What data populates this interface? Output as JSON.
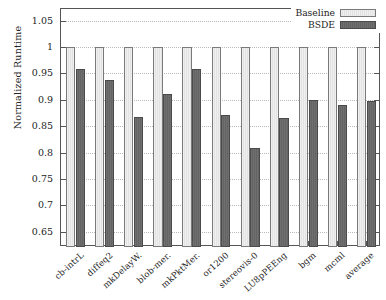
{
  "chart_data": {
    "type": "bar",
    "title": "",
    "xlabel": "",
    "ylabel": "Normalized Runtime",
    "ylim": [
      0.621,
      1.072
    ],
    "yticks": [
      0.65,
      0.7,
      0.75,
      0.8,
      0.85,
      0.9,
      0.95,
      1,
      1.05
    ],
    "ytick_labels": [
      "0.65",
      "0.7",
      "0.75",
      "0.8",
      "0.85",
      "0.9",
      "0.95",
      "1",
      "1.05"
    ],
    "grid": true,
    "legend_position": "top-right",
    "categories": [
      "cb-intrL",
      "diffeq2",
      "mkDelayW.",
      "blob-mer.",
      "mkPktMer.",
      "or1200",
      "stereovis-0",
      "LU8pPEEng",
      "bgm",
      "mcml",
      "average"
    ],
    "series": [
      {
        "name": "Baseline",
        "color": "#e8e8e8",
        "values": [
          1,
          1,
          1,
          1,
          1,
          1,
          1,
          1,
          1,
          1,
          1
        ]
      },
      {
        "name": "BSDE",
        "color": "#6a6a6a",
        "values": [
          0.958,
          0.937,
          0.867,
          0.911,
          0.958,
          0.872,
          0.809,
          0.866,
          0.899,
          0.891,
          0.897
        ]
      }
    ]
  },
  "legend": {
    "items": [
      {
        "label": "Baseline",
        "swatch": "baseline"
      },
      {
        "label": "BSDE",
        "swatch": "bsde"
      }
    ]
  }
}
